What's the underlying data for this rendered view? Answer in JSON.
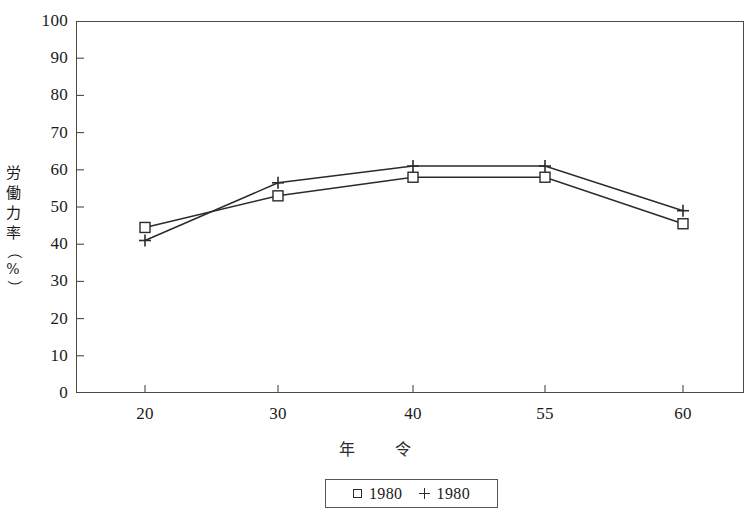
{
  "chart_data": {
    "type": "line",
    "title": "",
    "xlabel": "年　令",
    "ylabel": "労働力率（%）",
    "categories": [
      "20",
      "30",
      "40",
      "55",
      "60"
    ],
    "xlim": [
      0,
      4
    ],
    "ylim": [
      0,
      100
    ],
    "y_ticks": [
      "100",
      "90",
      "80",
      "70",
      "60",
      "50",
      "40",
      "30",
      "20",
      "10",
      "0"
    ],
    "y_tick_values": [
      100,
      90,
      80,
      70,
      60,
      50,
      40,
      30,
      20,
      10,
      0
    ],
    "grid": false,
    "legend_position": "bottom-center",
    "series": [
      {
        "name": "1980",
        "marker": "square",
        "values": [
          44.5,
          53.0,
          58.0,
          58.0,
          45.5
        ]
      },
      {
        "name": "1980",
        "marker": "plus",
        "values": [
          41.0,
          56.5,
          61.0,
          61.0,
          49.0
        ]
      }
    ]
  },
  "axis": {
    "y_title_chars": [
      "労",
      "働",
      "力",
      "率",
      "（",
      "%",
      "）"
    ],
    "x_title": "年　令"
  },
  "legend": {
    "entries": [
      {
        "marker_name": "square-marker",
        "label": "1980"
      },
      {
        "marker_name": "plus-marker",
        "label": "1980"
      }
    ]
  },
  "colors": {
    "line": "#2b2b2b",
    "axis": "#4a4a4a",
    "text": "#1a1a1a",
    "background": "#ffffff"
  }
}
